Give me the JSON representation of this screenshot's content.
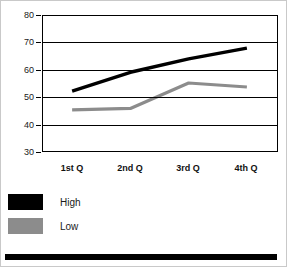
{
  "chart_data": {
    "type": "line",
    "title": "",
    "xlabel": "",
    "ylabel": "",
    "categories": [
      "1st Q",
      "2nd Q",
      "3rd Q",
      "4th Q"
    ],
    "ylim": [
      30,
      80
    ],
    "yticks": [
      80,
      70,
      60,
      50,
      40,
      30
    ],
    "grid": true,
    "legend_position": "below-left",
    "series": [
      {
        "name": "High",
        "color": "#000000",
        "values": [
          52,
          59,
          64,
          68
        ]
      },
      {
        "name": "Low",
        "color": "#8c8c8c",
        "values": [
          45,
          45.5,
          55,
          53.5
        ]
      }
    ]
  },
  "axis": {
    "y_labels": [
      "80",
      "70",
      "60",
      "50",
      "40",
      "30"
    ],
    "x_labels": [
      "1st Q",
      "2nd Q",
      "3rd Q",
      "4th Q"
    ]
  },
  "legend": {
    "items": [
      {
        "label": "High",
        "color": "#000000"
      },
      {
        "label": "Low",
        "color": "#8c8c8c"
      }
    ]
  },
  "colors": {
    "high_series": "#000000",
    "low_series": "#8c8c8c",
    "axis": "#000000",
    "frame": "#c9c9c9",
    "bottom_bar": "#000000"
  }
}
